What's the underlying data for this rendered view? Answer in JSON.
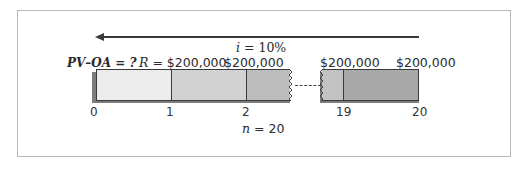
{
  "diagram": {
    "type": "annuity-timeline",
    "direction_arrow": "left",
    "interest_rate_label": "i = 10%",
    "interest_rate_symbol": "i",
    "interest_rate_value": "= 10%",
    "unknown_label": "PV–OA = ?",
    "payment_label_prefix": "R",
    "payment_label_first": "= $200,000",
    "payments": [
      "$200,000",
      "$200,000",
      "$200,000",
      "$200,000"
    ],
    "periods_symbol": "n",
    "periods_value": "= 20",
    "ticks": [
      "0",
      "1",
      "2",
      "19",
      "20"
    ],
    "colors": {
      "arrow": "#3a3a3a",
      "segment_0": "#ececec",
      "segment_1": "#d2d2d2",
      "segment_2": "#bdbdbd",
      "segment_3": "#c2c2c2",
      "segment_4": "#a9a9a9",
      "shadow": "#7d7d7d",
      "frame": "#b8b8b8"
    }
  }
}
